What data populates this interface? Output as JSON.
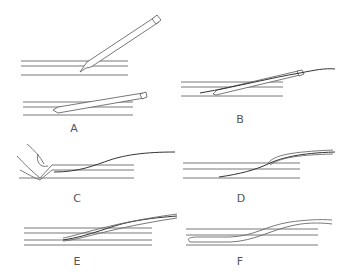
{
  "figure": {
    "panels": [
      {
        "id": "A",
        "label": "A",
        "description": "Needle inserted at steep angle into vessel, then lowered parallel"
      },
      {
        "id": "B",
        "label": "B",
        "description": "Guidewire advanced through needle into vessel"
      },
      {
        "id": "C",
        "label": "C",
        "description": "Needle withdrawn while finger compresses vessel; guidewire remains"
      },
      {
        "id": "D",
        "label": "D",
        "description": "Catheter/sheath threaded over guidewire"
      },
      {
        "id": "E",
        "label": "E",
        "description": "Catheter advanced into vessel over guidewire"
      },
      {
        "id": "F",
        "label": "F",
        "description": "Guidewire removed; catheter in place"
      }
    ],
    "colors": {
      "line": "#6a6a6a",
      "wire": "#333333",
      "label": "#555555",
      "background": "#ffffff"
    }
  }
}
